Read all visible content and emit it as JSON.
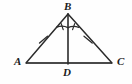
{
  "figure": {
    "name": "isosceles-triangle-with-altitude",
    "background_color": "#fefefe",
    "stroke_color": "#2b2b2b",
    "base_stroke_color": "#4a4a4a",
    "labels": {
      "apex": "B",
      "left_base": "A",
      "right_base": "C",
      "foot": "D"
    },
    "points": {
      "B": {
        "x": 68,
        "y": 14
      },
      "A": {
        "x": 26,
        "y": 63
      },
      "C": {
        "x": 112,
        "y": 63
      },
      "D": {
        "x": 68,
        "y": 63
      }
    },
    "segments": [
      {
        "name": "side-AB",
        "from": "A",
        "to": "B",
        "tick_marks": 1
      },
      {
        "name": "side-BC",
        "from": "B",
        "to": "C",
        "tick_marks": 1
      },
      {
        "name": "base-AC",
        "from": "A",
        "to": "C",
        "tick_marks": 0
      },
      {
        "name": "altitude-BD",
        "from": "B",
        "to": "D",
        "tick_marks": 0
      }
    ],
    "angle_marks": [
      {
        "name": "angle-ABD",
        "vertex": "B",
        "radius": 13,
        "tick_marks": 1
      },
      {
        "name": "angle-DBC",
        "vertex": "B",
        "radius": 13,
        "tick_marks": 1
      }
    ],
    "congruence": {
      "equal_sides": "AB = BC",
      "bisected_angle": "angle ABD = angle DBC"
    }
  }
}
